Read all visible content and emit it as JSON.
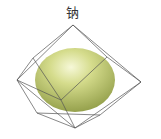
{
  "diagram": {
    "label": "钠",
    "sphere_color": "#c9d27a",
    "edge_color": "#555555"
  }
}
